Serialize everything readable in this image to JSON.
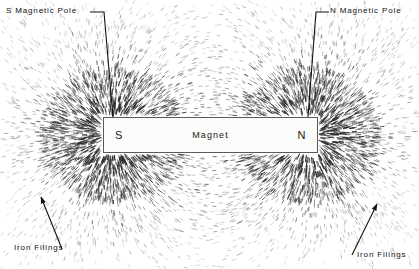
{
  "figure": {
    "background_color": "#ffffff",
    "filing_color": "#2b2b2b",
    "width": 419,
    "height": 269
  },
  "magnet": {
    "body_label": "Magnet",
    "south_pole_letter": "S",
    "north_pole_letter": "N",
    "fill_color": "#fbfbf9",
    "border_color": "#5a5a5a",
    "x": 103,
    "y": 117,
    "width": 215,
    "height": 36
  },
  "callouts": [
    {
      "id": "s-magnetic-pole",
      "text": "S Magnetic Pole",
      "leader": "polyline",
      "points": "90,12 104,12 113,117",
      "arrow": false
    },
    {
      "id": "n-magnetic-pole",
      "text": "N Magnetic Pole",
      "leader": "polyline",
      "points": "329,12 316,12 308,117",
      "arrow": false
    },
    {
      "id": "iron-filings-left",
      "text": "Iron Filings",
      "leader": "arrow",
      "points": "62,249 40,196",
      "arrow": true
    },
    {
      "id": "iron-filings-right",
      "text": "Iron Filings",
      "leader": "arrow",
      "points": "352,255 378,203",
      "arrow": true
    }
  ],
  "field_model": {
    "description": "Dipole field lines traced from the S pole to the N pole",
    "south_pole_point": [
      113,
      135
    ],
    "north_pole_point": [
      308,
      135
    ],
    "filing_count": 7200,
    "streak_length_min": 2.0,
    "streak_length_max": 6.5,
    "pole_density_boost": 3.4
  }
}
